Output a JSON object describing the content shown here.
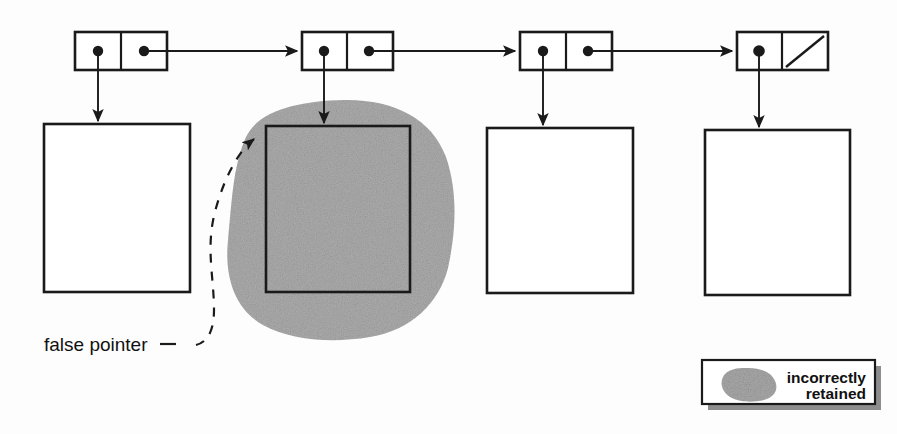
{
  "figure": {
    "kind": "memory-graph-diagram",
    "background_color": "#fdfdfd",
    "ink_color": "#1a1a1a",
    "shade_color": "#a9a9a9",
    "width": 897,
    "height": 434
  },
  "annotations": {
    "false_pointer_label": "false pointer",
    "false_pointer_leader": "dashed-curve"
  },
  "legend": {
    "swatch_name": "gray-blob-swatch",
    "line1": "incorrectly",
    "line2": "retained"
  },
  "cons_cells": [
    {
      "id": "cell-1",
      "car": "pointer-dot",
      "cdr": "pointer-dot",
      "points_to_block": "block-1",
      "next": "cell-2"
    },
    {
      "id": "cell-2",
      "car": "pointer-dot",
      "cdr": "pointer-dot",
      "points_to_block": "block-2",
      "next": "cell-3"
    },
    {
      "id": "cell-3",
      "car": "pointer-dot",
      "cdr": "pointer-dot",
      "points_to_block": "block-3",
      "next": "cell-4"
    },
    {
      "id": "cell-4",
      "car": "pointer-dot",
      "cdr": "nil-slash",
      "points_to_block": "block-4",
      "next": null
    }
  ],
  "blocks": [
    {
      "id": "block-1",
      "shaded": false,
      "label": ""
    },
    {
      "id": "block-2",
      "shaded": true,
      "label": ""
    },
    {
      "id": "block-3",
      "shaded": false,
      "label": ""
    },
    {
      "id": "block-4",
      "shaded": false,
      "label": ""
    }
  ]
}
